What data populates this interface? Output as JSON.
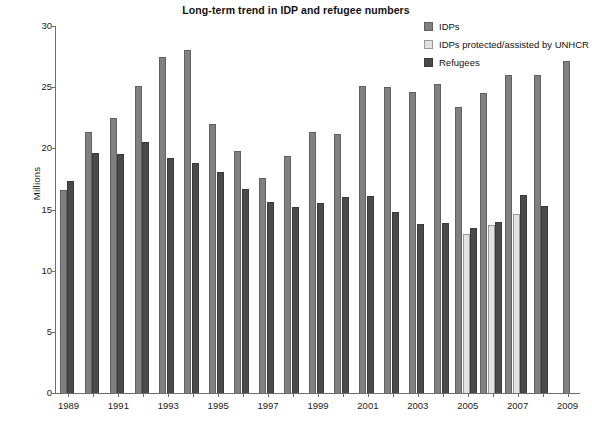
{
  "chart_data": {
    "type": "bar",
    "title": "Long-term trend in IDP and refugee numbers",
    "xlabel": "",
    "ylabel": "Millions",
    "ylim": [
      0,
      30
    ],
    "ytick_values": [
      0,
      5,
      10,
      15,
      20,
      25,
      30
    ],
    "ytick_labels": [
      "0",
      "5",
      "10",
      "15",
      "20",
      "25",
      "30"
    ],
    "grid": false,
    "legend_position": "top-right",
    "categories": [
      "1989",
      "1990",
      "1991",
      "1992",
      "1993",
      "1994",
      "1995",
      "1996",
      "1997",
      "1998",
      "1999",
      "2000",
      "2001",
      "2002",
      "2003",
      "2004",
      "2005",
      "2006",
      "2007",
      "2008",
      "2009"
    ],
    "xtick_labels_shown": [
      "1989",
      "",
      "1991",
      "",
      "1993",
      "",
      "1995",
      "",
      "1997",
      "",
      "1999",
      "",
      "2001",
      "",
      "2003",
      "",
      "2005",
      "",
      "2007",
      "",
      "2009"
    ],
    "series": [
      {
        "name": "IDPs",
        "color": "#808080",
        "values": [
          16.6,
          21.3,
          22.5,
          25.1,
          27.5,
          28.0,
          22.0,
          19.8,
          17.6,
          19.4,
          21.3,
          21.2,
          25.1,
          25.0,
          24.6,
          25.3,
          23.4,
          24.5,
          26.0,
          26.0,
          27.1
        ]
      },
      {
        "name": "IDPs protected/assisted by UNHCR",
        "color": "#e2e2e2",
        "values": [
          null,
          null,
          null,
          null,
          null,
          null,
          null,
          null,
          null,
          null,
          null,
          null,
          null,
          null,
          null,
          null,
          13.0,
          13.7,
          14.6,
          null,
          null
        ]
      },
      {
        "name": "Refugees",
        "color": "#4a4a4a",
        "values": [
          17.3,
          19.6,
          19.5,
          20.5,
          19.2,
          18.8,
          18.1,
          16.7,
          15.6,
          15.2,
          15.5,
          16.0,
          16.1,
          14.8,
          13.8,
          13.9,
          13.5,
          14.0,
          16.2,
          15.3,
          null
        ]
      }
    ]
  },
  "legend": {
    "items": [
      {
        "label": "IDPs",
        "swatch": "idp"
      },
      {
        "label": "IDPs protected/assisted by UNHCR",
        "swatch": "unhcr"
      },
      {
        "label": "Refugees",
        "swatch": "ref"
      }
    ]
  }
}
